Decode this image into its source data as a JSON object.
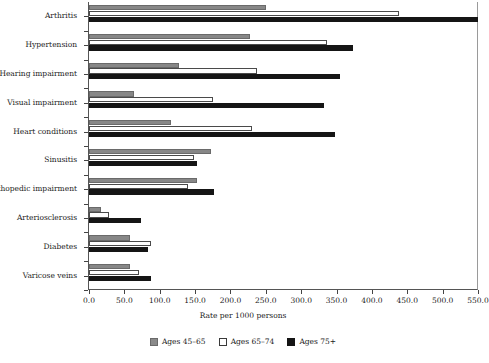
{
  "chart_data": {
    "type": "bar",
    "orientation": "horizontal",
    "title": "",
    "xlabel": "Rate per 1000 persons",
    "ylabel": "",
    "xlim": [
      0,
      550
    ],
    "xticks": [
      "0.0",
      "50.0",
      "100.0",
      "150.0",
      "200.0",
      "250.0",
      "300.0",
      "350.0",
      "400.0",
      "450.0",
      "500.0",
      "550.0"
    ],
    "xtick_values": [
      0,
      50,
      100,
      150,
      200,
      250,
      300,
      350,
      400,
      450,
      500,
      550
    ],
    "grid": false,
    "legend_position": "bottom",
    "categories": [
      "Arthritis",
      "Hypertension",
      "Hearing impairment",
      "Visual impairment",
      "Heart conditions",
      "Sinusitis",
      "Orthopedic impairment",
      "Arteriosclerosis",
      "Diabetes",
      "Varicose veins"
    ],
    "series": [
      {
        "name": "Ages 45–65",
        "color": "#8a8a8a",
        "values": [
          250,
          228,
          127,
          64,
          116,
          172,
          152,
          17,
          58,
          58
        ]
      },
      {
        "name": "Ages 65–74",
        "color": "#ffffff",
        "values": [
          438,
          337,
          237,
          176,
          230,
          149,
          140,
          28,
          88,
          71
        ]
      },
      {
        "name": "Ages 75+",
        "color": "#151515",
        "values": [
          550,
          373,
          355,
          332,
          348,
          153,
          177,
          73,
          84,
          87
        ]
      }
    ]
  },
  "legend": {
    "items": [
      {
        "label": "Ages 45–65",
        "swatch": "series-0-swatch"
      },
      {
        "label": "Ages 65–74",
        "swatch": "series-1-swatch"
      },
      {
        "label": "Ages 75+",
        "swatch": "series-2-swatch"
      }
    ]
  }
}
